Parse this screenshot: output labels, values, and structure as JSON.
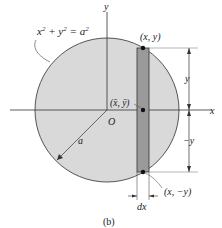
{
  "figure": {
    "caption": "(b)",
    "equation": {
      "x": "x",
      "sup1": "2",
      "plus": " + ",
      "y": "y",
      "sup2": "2",
      "eq": " = ",
      "a": "a",
      "sup3": "2"
    },
    "axes": {
      "x_label": "x",
      "y_label": "y",
      "origin_label": "O"
    },
    "points": {
      "top": "(x, y)",
      "centroid": "(x̄, ȳ)",
      "bottom": "(x, −y)"
    },
    "dimensions": {
      "upper": "y",
      "lower": "−y",
      "strip_width": "dx",
      "radius": "a"
    },
    "colors": {
      "disk_fill": "#d9d9d9",
      "strip_fill": "#9a9a9a",
      "line": "#333333"
    }
  }
}
